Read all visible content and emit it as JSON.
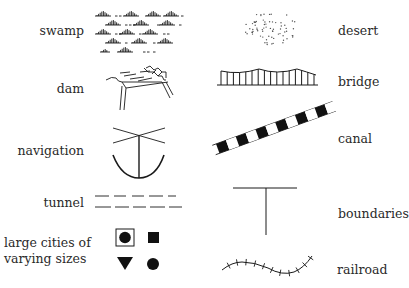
{
  "legend": {
    "left": [
      {
        "key": "swamp",
        "label": "swamp",
        "symbol": "swamp-tufts-icon"
      },
      {
        "key": "dam",
        "label": "dam",
        "symbol": "dam-icon"
      },
      {
        "key": "navigation",
        "label": "navigation",
        "symbol": "anchor-icon"
      },
      {
        "key": "tunnel",
        "label": "tunnel",
        "symbol": "dashed-parallel-lines-icon"
      },
      {
        "key": "cities",
        "label_line1": "large cities of",
        "label_line2": "varying sizes",
        "symbol": "city-markers-icon",
        "markers": [
          "boxed-circle",
          "square",
          "triangle-down",
          "circle"
        ]
      }
    ],
    "right": [
      {
        "key": "desert",
        "label": "desert",
        "symbol": "stipple-dots-icon"
      },
      {
        "key": "bridge",
        "label": "bridge",
        "symbol": "suspension-bridge-icon"
      },
      {
        "key": "canal",
        "label": "canal",
        "symbol": "checkered-band-icon"
      },
      {
        "key": "boundaries",
        "label": "boundaries",
        "symbol": "t-line-icon"
      },
      {
        "key": "railroad",
        "label": "railroad",
        "symbol": "hatched-curve-icon"
      }
    ]
  },
  "colors": {
    "ink": "#1a1a1a",
    "background": "#ffffff"
  }
}
